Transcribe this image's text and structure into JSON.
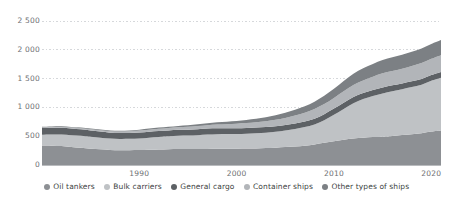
{
  "chart_data": {
    "type": "area",
    "stacked": true,
    "title": "",
    "subtitle": "",
    "xlabel": "",
    "ylabel": "",
    "xlim": [
      1980,
      2021
    ],
    "ylim": [
      0,
      2500
    ],
    "grid": true,
    "legend_position": "bottom",
    "y_ticks": [
      0,
      500,
      1000,
      1500,
      2000,
      2500
    ],
    "y_tick_labels": [
      "0",
      "500",
      "1 000",
      "1 500",
      "2 000",
      "2 500"
    ],
    "x_ticks": [
      1990,
      2000,
      2010,
      2020
    ],
    "x_tick_labels": [
      "1990",
      "2000",
      "2010",
      "2020"
    ],
    "x": [
      1980,
      1981,
      1982,
      1983,
      1984,
      1985,
      1986,
      1987,
      1988,
      1989,
      1990,
      1991,
      1992,
      1993,
      1994,
      1995,
      1996,
      1997,
      1998,
      1999,
      2000,
      2001,
      2002,
      2003,
      2004,
      2005,
      2006,
      2007,
      2008,
      2009,
      2010,
      2011,
      2012,
      2013,
      2014,
      2015,
      2016,
      2017,
      2018,
      2019,
      2020,
      2021
    ],
    "series": [
      {
        "name": "Oil tankers",
        "color": "#8d9094",
        "values": [
          339,
          336,
          329,
          313,
          299,
          284,
          274,
          262,
          258,
          258,
          259,
          264,
          269,
          274,
          278,
          277,
          277,
          279,
          281,
          283,
          282,
          285,
          288,
          294,
          300,
          311,
          322,
          336,
          357,
          386,
          414,
          440,
          459,
          473,
          484,
          492,
          505,
          520,
          534,
          552,
          582,
          601
        ]
      },
      {
        "name": "Bulk carriers",
        "color": "#bfc2c5",
        "values": [
          186,
          193,
          201,
          205,
          207,
          206,
          201,
          197,
          195,
          197,
          203,
          211,
          218,
          224,
          229,
          234,
          241,
          249,
          253,
          255,
          256,
          259,
          263,
          268,
          276,
          288,
          303,
          322,
          346,
          391,
          457,
          532,
          614,
          672,
          714,
          751,
          777,
          796,
          818,
          842,
          879,
          913
        ]
      },
      {
        "name": "General cargo",
        "color": "#5d6165",
        "values": [
          116,
          117,
          118,
          117,
          115,
          110,
          105,
          103,
          101,
          101,
          103,
          104,
          104,
          103,
          103,
          103,
          104,
          104,
          103,
          101,
          101,
          100,
          100,
          99,
          98,
          97,
          96,
          97,
          100,
          106,
          108,
          109,
          108,
          106,
          105,
          104,
          102,
          101,
          101,
          101,
          101,
          102
        ]
      },
      {
        "name": "Container ships",
        "color": "#b2b5b9",
        "values": [
          11,
          12,
          13,
          15,
          17,
          20,
          22,
          24,
          26,
          29,
          32,
          35,
          38,
          42,
          45,
          49,
          54,
          59,
          65,
          70,
          77,
          84,
          90,
          98,
          110,
          122,
          137,
          152,
          170,
          175,
          184,
          198,
          209,
          217,
          229,
          244,
          247,
          253,
          266,
          275,
          281,
          291
        ]
      },
      {
        "name": "Other types of ships",
        "color": "#7c8084",
        "values": [
          10,
          10,
          11,
          11,
          11,
          12,
          13,
          14,
          15,
          16,
          17,
          18,
          20,
          22,
          24,
          26,
          30,
          34,
          39,
          44,
          49,
          55,
          62,
          70,
          79,
          89,
          100,
          112,
          126,
          143,
          160,
          178,
          196,
          210,
          222,
          231,
          238,
          244,
          249,
          254,
          259,
          264
        ]
      }
    ]
  },
  "legend": {
    "items": [
      {
        "label": "Oil tankers",
        "color": "#8d9094"
      },
      {
        "label": "Bulk carriers",
        "color": "#bfc2c5"
      },
      {
        "label": "General cargo",
        "color": "#5d6165"
      },
      {
        "label": "Container ships",
        "color": "#b2b5b9"
      },
      {
        "label": "Other types of ships",
        "color": "#7c8084"
      }
    ]
  },
  "axes": {
    "y_labels": [
      "2 500",
      "2 000",
      "1 500",
      "1 000",
      "500",
      "0"
    ],
    "x_labels": [
      "1990",
      "2000",
      "2010",
      "2020"
    ]
  },
  "style": {
    "grid_color": "#d6d8db",
    "axis_color": "#b9bbbe",
    "tick_text_color": "#6d6f72",
    "legend_text_color": "#3c3f42",
    "background": "#ffffff"
  }
}
